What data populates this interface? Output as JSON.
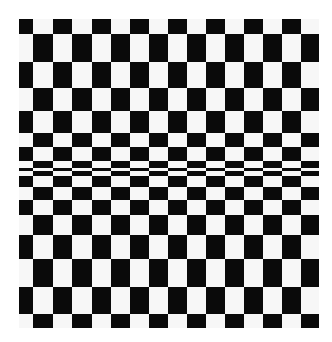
{
  "image": {
    "description": "Black and white checkerboard optical illusion with rows compressed toward the middle",
    "colors": {
      "dark": "#0a0a0a",
      "light": "#f7f7f7",
      "background": "#ffffff"
    }
  },
  "board": {
    "left": 19,
    "right": 319,
    "columns": [
      19,
      33,
      53,
      72,
      92,
      111,
      130,
      149,
      168,
      187,
      206,
      225,
      244,
      263,
      282,
      301,
      319
    ],
    "rows": [
      {
        "top": 19,
        "bottom": 34,
        "first": "b"
      },
      {
        "top": 34,
        "bottom": 62,
        "first": "w"
      },
      {
        "top": 62,
        "bottom": 88,
        "first": "b"
      },
      {
        "top": 88,
        "bottom": 111,
        "first": "w"
      },
      {
        "top": 111,
        "bottom": 133,
        "first": "b"
      },
      {
        "top": 133,
        "bottom": 147,
        "first": "w"
      },
      {
        "top": 147,
        "bottom": 161,
        "first": "b"
      },
      {
        "top": 161,
        "bottom": 168,
        "first": "w"
      },
      {
        "top": 168,
        "bottom": 171,
        "first": "b"
      },
      {
        "top": 171,
        "bottom": 176,
        "first": "w"
      },
      {
        "top": 176,
        "bottom": 187,
        "first": "b"
      },
      {
        "top": 187,
        "bottom": 200,
        "first": "w"
      },
      {
        "top": 200,
        "bottom": 215,
        "first": "b"
      },
      {
        "top": 215,
        "bottom": 235,
        "first": "w"
      },
      {
        "top": 235,
        "bottom": 259,
        "first": "b"
      },
      {
        "top": 259,
        "bottom": 287,
        "first": "w"
      },
      {
        "top": 287,
        "bottom": 314,
        "first": "b"
      },
      {
        "top": 314,
        "bottom": 328,
        "first": "w"
      }
    ]
  }
}
